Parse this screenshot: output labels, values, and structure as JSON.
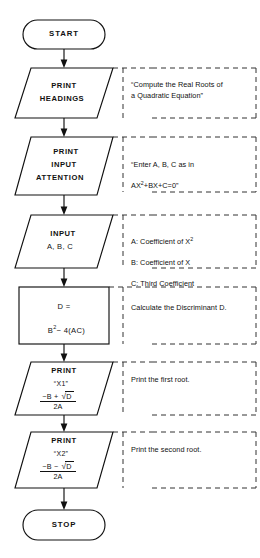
{
  "diagram": {
    "line_color": "#111111",
    "annotation_color": "#222222",
    "background": "#ffffff"
  },
  "nodes": [
    {
      "id": "start",
      "shape": "terminator",
      "label": "START",
      "note": ""
    },
    {
      "id": "print-headings",
      "shape": "parallelogram",
      "label_line1": "PRINT",
      "label_line2": "HEADINGS",
      "note": "“Compute the Real Roots of\na Quadratic Equation”"
    },
    {
      "id": "print-input-attention",
      "shape": "parallelogram",
      "label_line1": "PRINT",
      "label_line2": "INPUT",
      "label_line3": "ATTENTION",
      "note_line1": "“Enter A, B, C as in",
      "note_line2_pre": "AX",
      "note_line2_sup": "2",
      "note_line2_post": "+BX+C=0”"
    },
    {
      "id": "input-abc",
      "shape": "parallelogram",
      "label_line1": "INPUT",
      "label_line2": "A, B, C",
      "note_line1_pre": "A:  Coefficient of X",
      "note_line1_sup": "2",
      "note_line2": "B:  Coefficient of X",
      "note_line3": "C:  Third Coefficient"
    },
    {
      "id": "compute-discriminant",
      "shape": "process",
      "label_line1": "D =",
      "label_line2_pre": "B",
      "label_line2_sup": "2",
      "label_line2_post": "− 4(AC)",
      "note": "Calculate the Discriminant D."
    },
    {
      "id": "print-x1",
      "shape": "parallelogram",
      "label_line1": "PRINT",
      "label_line2": "“X1”",
      "formula_numerator_pre": "−B +",
      "formula_radical": "√",
      "formula_radicand": "D",
      "formula_denominator": "2A",
      "note": "Print the first root."
    },
    {
      "id": "print-x2",
      "shape": "parallelogram",
      "label_line1": "PRINT",
      "label_line2": "“X2”",
      "formula_numerator_pre": "−B −",
      "formula_radical": "√",
      "formula_radicand": "D",
      "formula_denominator": "2A",
      "note": "Print the second root."
    },
    {
      "id": "stop",
      "shape": "terminator",
      "label": "STOP",
      "note": ""
    }
  ]
}
